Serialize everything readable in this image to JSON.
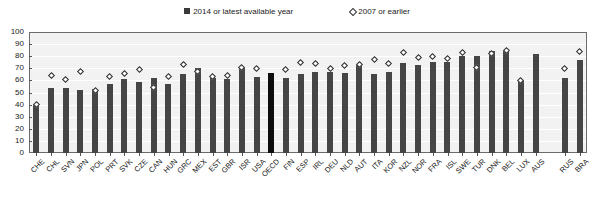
{
  "legend": {
    "position": "top-center",
    "entries": [
      {
        "label": "2014 or latest available year",
        "marker": "filled-square-icon",
        "color": "#3a3a3a"
      },
      {
        "label": "2007 or earlier",
        "marker": "open-diamond-icon",
        "color": "#ffffff"
      }
    ]
  },
  "axis": {
    "y_ticks": [
      "100",
      "90",
      "80",
      "70",
      "60",
      "50",
      "40",
      "30",
      "20",
      "10",
      "0"
    ]
  },
  "chart_data": {
    "type": "bar",
    "title": "",
    "subtitle": "",
    "xlabel": "",
    "ylabel": "",
    "ylim": [
      0,
      100
    ],
    "ytick_step": 10,
    "grid": true,
    "legend_position": "top-center",
    "categories": [
      "CHE",
      "CHL",
      "SVN",
      "JPN",
      "POL",
      "PRT",
      "SVK",
      "CZE",
      "CAN",
      "HUN",
      "GRC",
      "MEX",
      "EST",
      "GBR",
      "ISR",
      "USA",
      "OECD",
      "FIN",
      "ESP",
      "IRL",
      "DEU",
      "NLD",
      "AUT",
      "ITA",
      "KOR",
      "NZL",
      "NOR",
      "FRA",
      "ISL",
      "SWE",
      "TUR",
      "DNK",
      "BEL",
      "LUX",
      "AUS",
      "",
      "RUS",
      "BRA"
    ],
    "series": [
      {
        "name": "2014 or latest available year",
        "marker": "bar",
        "color": "#454545",
        "values": [
          40,
          54,
          54,
          52,
          53,
          57,
          61,
          59,
          62,
          57,
          65,
          70,
          62,
          61,
          71,
          63,
          66,
          62,
          65,
          67,
          67,
          66,
          73,
          65,
          67,
          74,
          73,
          75,
          75,
          80,
          80,
          84,
          84,
          60,
          82,
          null,
          62,
          77
        ]
      },
      {
        "name": "2007 or earlier",
        "marker": "open-diamond",
        "color": "#ffffff",
        "values": [
          40,
          64,
          61,
          67,
          52,
          63,
          66,
          69,
          54,
          63,
          73,
          67,
          63,
          64,
          71,
          70,
          null,
          69,
          75,
          74,
          70,
          72,
          73,
          77,
          74,
          83,
          79,
          80,
          78,
          83,
          71,
          82,
          85,
          60,
          null,
          null,
          70,
          84
        ]
      }
    ],
    "highlighted_category": "OECD",
    "highlight_color": "#0d0d0d"
  }
}
